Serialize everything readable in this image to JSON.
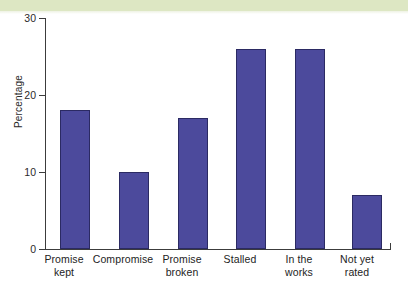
{
  "page": {
    "banner_color": "#dde7c3",
    "background_color": "#ffffff"
  },
  "chart_data": {
    "type": "bar",
    "title": "",
    "subtitle": "",
    "xlabel": "",
    "ylabel": "Percentage",
    "ylim": [
      0,
      30
    ],
    "yticks": [
      0,
      10,
      20,
      30
    ],
    "ytick_labels": [
      "0",
      "10",
      "20",
      "30"
    ],
    "grid": false,
    "legend": null,
    "bar_color": "#4c4a9c",
    "bar_edge_color": "#2b2a63",
    "categories": [
      "Promise kept",
      "Compromise",
      "Promise broken",
      "Stalled",
      "In the works",
      "Not yet rated"
    ],
    "category_lines": [
      [
        "Promise",
        "kept"
      ],
      [
        "Compromise",
        ""
      ],
      [
        "Promise",
        "broken"
      ],
      [
        "Stalled",
        ""
      ],
      [
        "In the",
        "works"
      ],
      [
        "Not yet",
        "rated"
      ]
    ],
    "values": [
      18,
      10,
      17,
      26,
      26,
      7
    ]
  }
}
